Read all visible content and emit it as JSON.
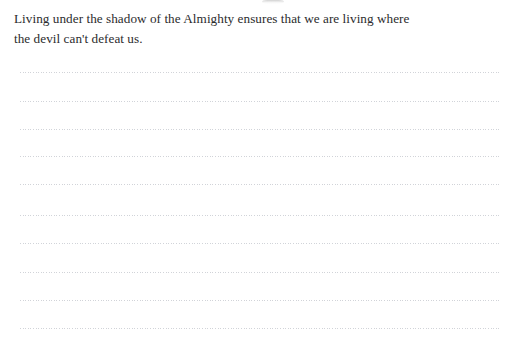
{
  "page": {
    "width": 521,
    "height": 341,
    "background_color": "#ffffff",
    "kind": "ruled-journal-page"
  },
  "quote": {
    "full_text": "Living under the shadow of the Almighty ensures that we are living where the devil can't defeat us.",
    "lines": [
      "Living under the shadow of the Almighty ensures that we are living where",
      "the devil can't defeat us."
    ],
    "text_color": "#2b2b2d",
    "font_size_px": 13.2,
    "line_height_px": 20
  },
  "ruled_lines": {
    "count": 10,
    "style": "dotted",
    "color": "#c9ccd2",
    "left_px": 20,
    "right_px": 500,
    "width_px": 480,
    "first_line_y_px": 72,
    "spacing_px": 28.4,
    "y_positions": [
      72,
      101,
      129,
      156,
      184,
      215,
      243,
      272,
      300,
      328
    ]
  },
  "artifact": {
    "name": "clipped-text-remnant",
    "description": "faint grey smudge at the very top edge, bottom of a cropped line of text",
    "x_px": 262,
    "y_px": 0,
    "color": "#aaaaaa"
  }
}
